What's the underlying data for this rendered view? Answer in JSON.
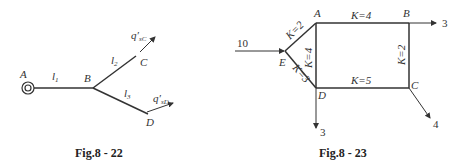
{
  "fig1": {
    "caption": "Fig.8 - 22",
    "nodes": {
      "A": "A",
      "B": "B",
      "C": "C",
      "D": "D"
    },
    "edges": {
      "l1": "l",
      "l1_sub": "1",
      "l2": "l",
      "l2_sub": "2",
      "l3": "l",
      "l3_sub": "3"
    },
    "flows": {
      "qC": "q′",
      "qC_sub": "sC",
      "qD": "q′",
      "qD_sub": "sD"
    }
  },
  "fig2": {
    "caption": "Fig.8 - 23",
    "nodes": {
      "A": "A",
      "B": "B",
      "C": "C",
      "D": "D",
      "E": "E"
    },
    "edges": {
      "AB": "K=4",
      "EA": "K=2",
      "AD": "K=4",
      "ED": "K=3",
      "BC": "K=2",
      "DC": "K=5"
    },
    "flows": {
      "inE": "10",
      "outB": "3",
      "outD": "3",
      "outC": "4"
    }
  },
  "colors": {
    "line": "#333333",
    "text": "#333333"
  }
}
